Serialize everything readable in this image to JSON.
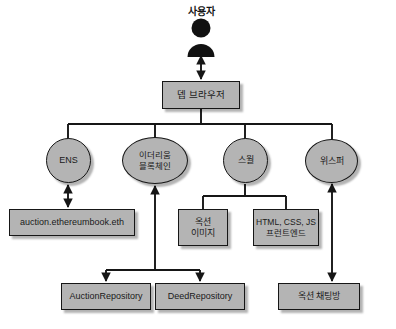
{
  "diagram": {
    "colors": {
      "node_fill": "#b4b4b4",
      "node_stroke": "#161616",
      "background": "#ffffff",
      "actor": "#111111"
    },
    "actor": {
      "label": "사용자",
      "icon": "person-icon"
    },
    "nodes": [
      {
        "id": "browser",
        "label": "뎁 브라우저",
        "shape": "box",
        "x": 162,
        "y": 81,
        "w": 78,
        "h": 28,
        "font_size": 9.5
      },
      {
        "id": "ens",
        "label": "ENS",
        "shape": "ellipse",
        "x": 46,
        "y": 138,
        "w": 45,
        "h": 45,
        "font_size": 9
      },
      {
        "id": "ethereum",
        "label": "이더리움\n블록체인",
        "shape": "ellipse",
        "x": 122,
        "y": 137,
        "w": 66,
        "h": 47,
        "font_size": 8.5
      },
      {
        "id": "swarm",
        "label": "스월",
        "shape": "ellipse",
        "x": 223,
        "y": 138,
        "w": 45,
        "h": 45,
        "font_size": 9
      },
      {
        "id": "whisper",
        "label": "위스퍼",
        "shape": "ellipse",
        "x": 305,
        "y": 139,
        "w": 53,
        "h": 44,
        "font_size": 9
      },
      {
        "id": "ensname",
        "label": "auction.ethereumbook.eth",
        "shape": "box",
        "x": 9,
        "y": 209,
        "w": 126,
        "h": 27,
        "font_size": 9
      },
      {
        "id": "image",
        "label": "옥션\n이미지",
        "shape": "box",
        "x": 178,
        "y": 209,
        "w": 50,
        "h": 37,
        "font_size": 9
      },
      {
        "id": "frontend",
        "label": "HTML, CSS, JS\n프런트엔드",
        "shape": "box",
        "x": 253,
        "y": 209,
        "w": 66,
        "h": 37,
        "font_size": 8.5
      },
      {
        "id": "auctionrepo",
        "label": "AuctionRepository",
        "shape": "box",
        "x": 61,
        "y": 283,
        "w": 90,
        "h": 27,
        "font_size": 9
      },
      {
        "id": "deedrepo",
        "label": "DeedRepository",
        "shape": "box",
        "x": 155,
        "y": 283,
        "w": 90,
        "h": 27,
        "font_size": 9
      },
      {
        "id": "chatroom",
        "label": "옥션 채팅방",
        "shape": "box",
        "x": 278,
        "y": 283,
        "w": 82,
        "h": 27,
        "font_size": 9
      }
    ],
    "edges": [
      {
        "from": "browser",
        "to": "actor",
        "arrows": "both"
      },
      {
        "from": "browser",
        "to": "ens",
        "arrows": "none"
      },
      {
        "from": "browser",
        "to": "ethereum",
        "arrows": "none"
      },
      {
        "from": "browser",
        "to": "swarm",
        "arrows": "none"
      },
      {
        "from": "browser",
        "to": "whisper",
        "arrows": "none"
      },
      {
        "from": "ens",
        "to": "ensname",
        "arrows": "both"
      },
      {
        "from": "swarm",
        "to": "image",
        "arrows": "none"
      },
      {
        "from": "swarm",
        "to": "frontend",
        "arrows": "none"
      },
      {
        "from": "ethereum",
        "to": "auctionrepo",
        "arrows": "both"
      },
      {
        "from": "ethereum",
        "to": "deedrepo",
        "arrows": "both"
      },
      {
        "from": "whisper",
        "to": "chatroom",
        "arrows": "both"
      }
    ]
  }
}
